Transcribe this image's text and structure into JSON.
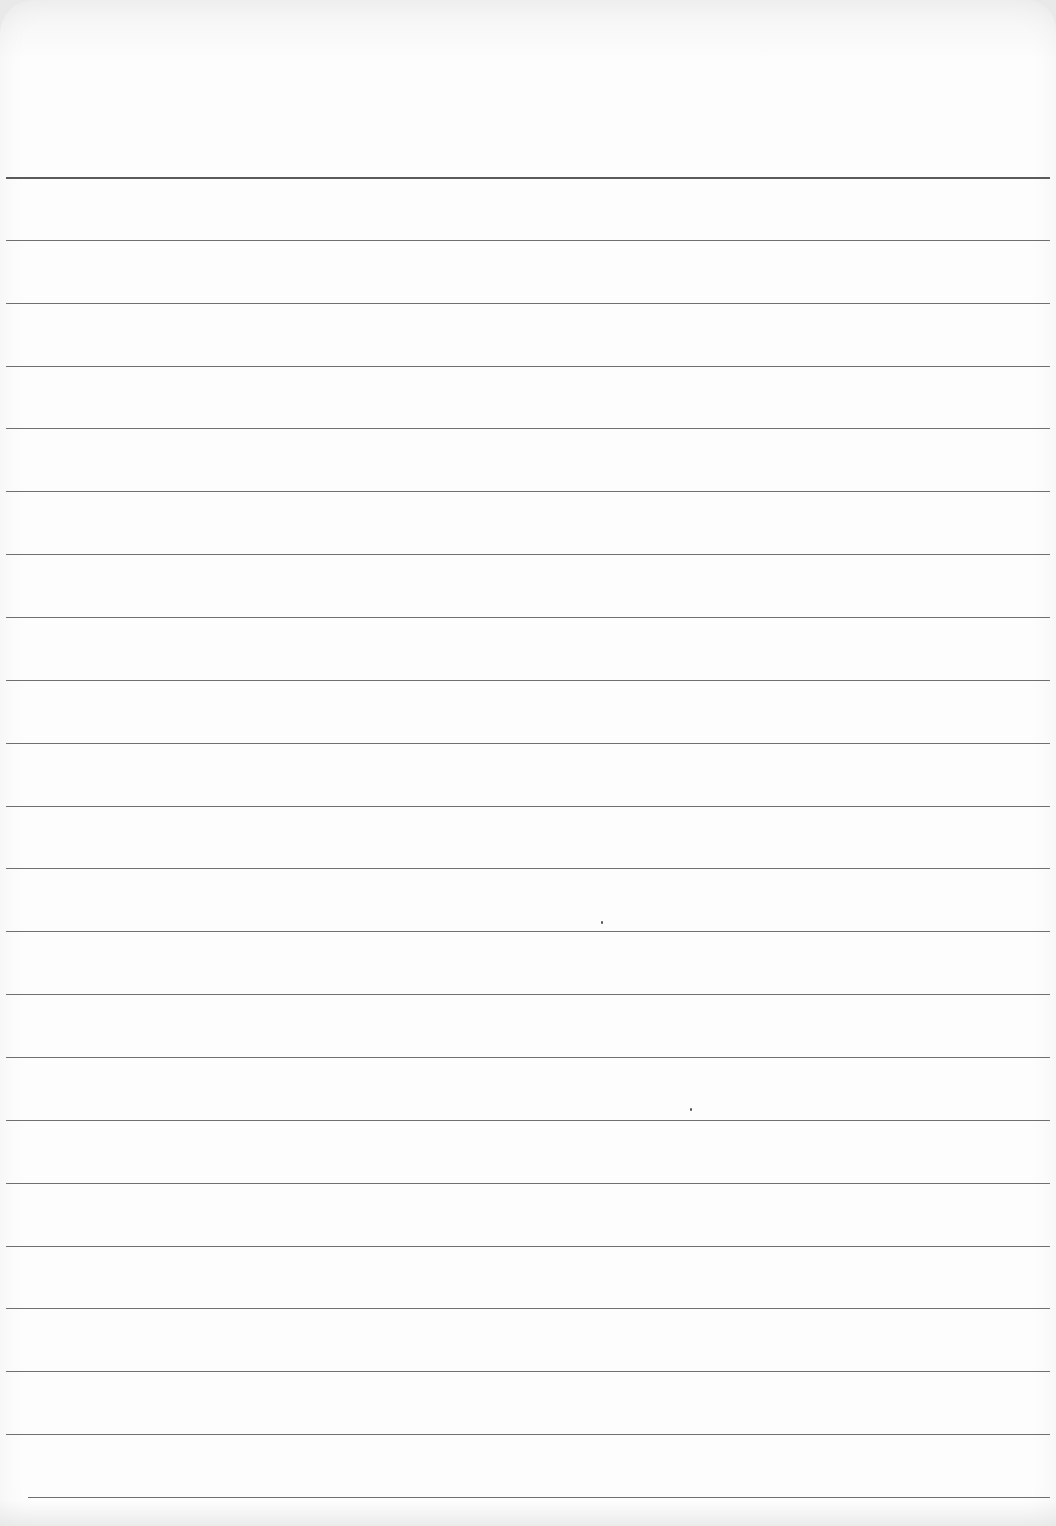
{
  "page": {
    "type": "ruled-notebook-sheet",
    "background_color": "#fdfdfd",
    "line_color": "#6f6f6f",
    "text_content": ""
  },
  "rules": {
    "count": 22,
    "first_y": 177,
    "spacing": 62.86,
    "left": 6,
    "right": 1050,
    "last_left": 28
  },
  "specks": [
    {
      "x": 601,
      "y": 921
    },
    {
      "x": 690,
      "y": 1108
    }
  ]
}
